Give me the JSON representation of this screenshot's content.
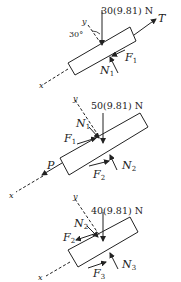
{
  "diagrams": [
    {
      "weight_label": "30(9.81) N",
      "angle_label": "30°",
      "axis_x": "x",
      "axis_y": "y",
      "forces": {
        "T": "T",
        "F1": "F",
        "F1_sub": "1",
        "N1": "N",
        "N1_sub": "1"
      }
    },
    {
      "weight_label": "50(9.81) N",
      "axis_x": "x",
      "axis_y": "y",
      "forces": {
        "P": "P",
        "N1": "N",
        "N1_sub": "1",
        "F1": "F",
        "F1_sub": "1",
        "F2": "F",
        "F2_sub": "2",
        "N2": "N",
        "N2_sub": "2"
      }
    },
    {
      "weight_label": "40(9.81) N",
      "axis_x": "x",
      "axis_y": "y",
      "forces": {
        "N2": "N",
        "N2_sub": "2",
        "F2": "F",
        "F2_sub": "2",
        "F3": "F",
        "F3_sub": "3",
        "N3": "N",
        "N3_sub": "3"
      }
    }
  ],
  "colors": {
    "ink": "#222222",
    "background": "#ffffff"
  }
}
